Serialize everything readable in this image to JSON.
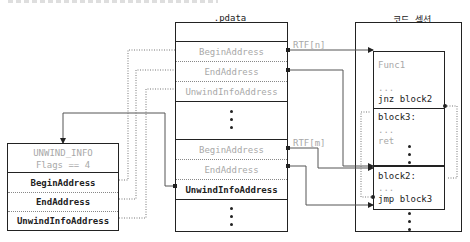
{
  "pdata": {
    "title": ".pdata",
    "entries": [
      {
        "label": "BeginAddress",
        "rtf": "RTF[n]"
      },
      {
        "label": "EndAddress"
      },
      {
        "label": "UnwindInfoAddress"
      },
      {
        "label": "BeginAddress",
        "rtf": "RTF[m]"
      },
      {
        "label": "EndAddress"
      },
      {
        "label": "UnwindInfoAddress"
      }
    ]
  },
  "unwind_info": {
    "header_line1": "UNWIND_INFO",
    "header_line2": "Flags == 4",
    "fields": [
      "BeginAddress",
      "EndAddress",
      "UnwindInfoAddress"
    ]
  },
  "code_section": {
    "title": "코드 섹션",
    "func_label": "Func1",
    "func_lines": [
      "...",
      "jnz block2"
    ],
    "block3_lines": [
      "block3:",
      "...",
      "ret"
    ],
    "block2_lines": [
      "block2:",
      "...",
      "jmp block3"
    ]
  }
}
